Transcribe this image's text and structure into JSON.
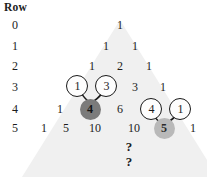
{
  "header": {
    "row_label": "Row"
  },
  "row_labels": [
    "0",
    "1",
    "2",
    "3",
    "4",
    "5"
  ],
  "triangle": {
    "rows": [
      {
        "row": "0",
        "values": [
          "1"
        ]
      },
      {
        "row": "1",
        "values": [
          "1",
          "1"
        ]
      },
      {
        "row": "2",
        "values": [
          "1",
          "2",
          "1"
        ]
      },
      {
        "row": "3",
        "values": [
          "1",
          "3",
          "3",
          "1"
        ]
      },
      {
        "row": "4",
        "values": [
          "1",
          "4",
          "6",
          "4",
          "1"
        ]
      },
      {
        "row": "5",
        "values": [
          "1",
          "5",
          "10",
          "10",
          "5",
          "1"
        ]
      }
    ]
  },
  "annotations": {
    "callouts": [
      {
        "value": "1",
        "style": "outline",
        "from_row": "3",
        "points_to": "4-in-row-4"
      },
      {
        "value": "3",
        "style": "outline",
        "from_row": "3",
        "points_to": "4-in-row-4"
      },
      {
        "value": "4",
        "style": "outline",
        "from_row": "4",
        "points_to": "5-in-row-5"
      },
      {
        "value": "1",
        "style": "outline",
        "from_row": "4",
        "points_to": "5-in-row-5"
      }
    ],
    "highlighted": [
      {
        "value": "4",
        "row": "4",
        "style": "filled-dark",
        "color": "#7b7b7b"
      },
      {
        "value": "5",
        "row": "5",
        "style": "filled-light",
        "color": "#b9b9b9"
      }
    ],
    "continuation": [
      "?",
      "?"
    ]
  },
  "colors": {
    "triangle_fill": "#f0f0f0",
    "dark_disc": "#7b7b7b",
    "light_disc": "#b9b9b9",
    "text": "#1c1c1c",
    "background": "#ffffff"
  }
}
